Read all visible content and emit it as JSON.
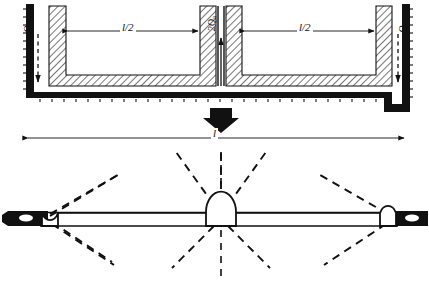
{
  "figure": {
    "background_color": "#ffffff",
    "ink_color": "#000000"
  },
  "upper_diagram": {
    "name": "channel-cross-section",
    "description": "Hatched channel / box cross-section with two bays separated by a central web, enclosed by a serrated outer boundary wall",
    "hatch_angle_deg": 45,
    "dimensions": [
      {
        "id": "left-half-span",
        "label": "l/2",
        "arrow_style": "double-headed"
      },
      {
        "id": "right-half-span",
        "label": "l/2",
        "arrow_style": "double-headed"
      }
    ],
    "loads": [
      {
        "id": "load-left",
        "label": "Q",
        "subscript": "a",
        "direction": "down",
        "line_style": "dashed",
        "position": "left-outer-wall"
      },
      {
        "id": "load-center",
        "label": "2Q",
        "subscript": "a",
        "direction": "up",
        "line_style": "solid",
        "position": "central-web"
      },
      {
        "id": "load-right",
        "label": "Q",
        "subscript": "a",
        "direction": "down",
        "line_style": "dashed",
        "position": "right-outer-wall"
      }
    ]
  },
  "transition": {
    "name": "implies-arrow",
    "glyph": "block-down-arrow",
    "direction": "down",
    "fill": "#000000"
  },
  "overall_dimension": {
    "id": "full-span",
    "label": "l",
    "arrow_style": "double-headed",
    "spans": "full width of the structure"
  },
  "lower_diagram": {
    "name": "collapse-mechanism",
    "description": "Two-span beam collapse mechanism: three plastic hinges with radiating dashed slip-line fans and a vertical dashed centre line",
    "beam": {
      "style": "double-line",
      "color": "#000000"
    },
    "supports": [
      {
        "id": "support-left",
        "type": "fixed-block",
        "fill": "#000000",
        "hinge": "semicircular"
      },
      {
        "id": "support-right",
        "type": "fixed-block",
        "fill": "#000000",
        "hinge": "semicircular"
      }
    ],
    "hinges": [
      {
        "id": "hinge-left",
        "shape": "semicircle",
        "fan_rays_above": 2,
        "fan_rays_below": 2
      },
      {
        "id": "hinge-center",
        "shape": "semicircle",
        "fan_rays_above": 3,
        "fan_rays_below": 3
      },
      {
        "id": "hinge-right",
        "shape": "semicircle",
        "fan_rays_above": 2,
        "fan_rays_below": 2
      }
    ],
    "centre_line": {
      "style": "dashed",
      "orientation": "vertical"
    }
  }
}
